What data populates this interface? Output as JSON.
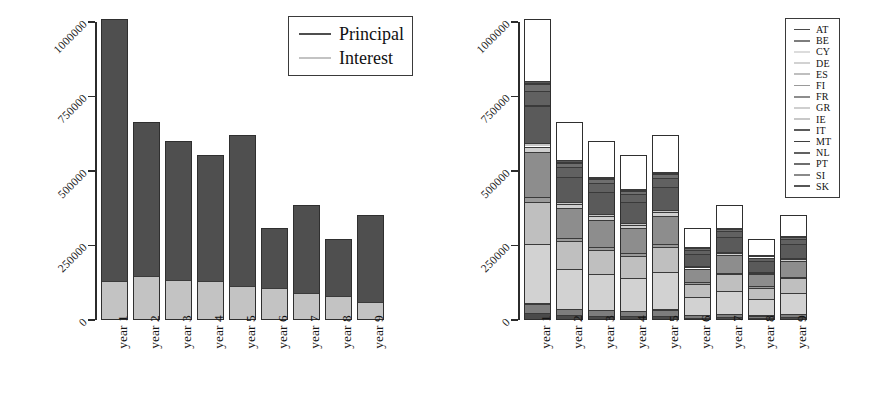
{
  "figure": {
    "background": "#ffffff",
    "ink_color": "#1a1a1a"
  },
  "axis": {
    "y_ticks": [
      "0",
      "250000",
      "500000",
      "750000",
      "1000000"
    ],
    "y_tick_values": [
      0,
      250000,
      500000,
      750000,
      1000000
    ],
    "y_min": 0,
    "y_max": 1050000,
    "x_categories": [
      "year 1",
      "year 2",
      "year 3",
      "year 4",
      "year 5",
      "year 6",
      "year 7",
      "year 8",
      "year 9"
    ]
  },
  "left_panel": {
    "legend": {
      "entries": [
        {
          "label": "Principal",
          "color": "#4f4f4f"
        },
        {
          "label": "Interest",
          "color": "#c3c3c3"
        }
      ]
    }
  },
  "right_panel": {
    "legend": {
      "entries": [
        {
          "label": "AT",
          "color": "#4a4a4a"
        },
        {
          "label": "BE",
          "color": "#7d7d7d"
        },
        {
          "label": "CY",
          "color": "#dcdcdc"
        },
        {
          "label": "DE",
          "color": "#d2d2d2"
        },
        {
          "label": "ES",
          "color": "#bfbfbf"
        },
        {
          "label": "FI",
          "color": "#9a9a9a"
        },
        {
          "label": "FR",
          "color": "#8d8d8d"
        },
        {
          "label": "GR",
          "color": "#cfcfcf"
        },
        {
          "label": "IE",
          "color": "#c8c8c8"
        },
        {
          "label": "IT",
          "color": "#5a5a5a"
        },
        {
          "label": "MT",
          "color": "#3f3f3f"
        },
        {
          "label": "NL",
          "color": "#616161"
        },
        {
          "label": "PT",
          "color": "#6e6e6e"
        },
        {
          "label": "SI",
          "color": "#8a8a8a"
        },
        {
          "label": "SK",
          "color": "#565656"
        }
      ]
    }
  },
  "chart_data": [
    {
      "id": "principal-interest-chart",
      "type": "bar",
      "stacked": true,
      "title": "",
      "xlabel": "",
      "ylabel": "",
      "ylim": [
        0,
        1050000
      ],
      "grid": false,
      "legend_position": "top-right",
      "categories": [
        "year 1",
        "year 2",
        "year 3",
        "year 4",
        "year 5",
        "year 6",
        "year 7",
        "year 8",
        "year 9"
      ],
      "series": [
        {
          "name": "Interest",
          "color": "#c3c3c3",
          "values": [
            130000,
            148000,
            135000,
            132000,
            115000,
            108000,
            90000,
            80000,
            62000
          ]
        },
        {
          "name": "Principal",
          "color": "#4f4f4f",
          "values": [
            880000,
            517000,
            465000,
            423000,
            505000,
            200000,
            295000,
            192000,
            291000
          ]
        }
      ],
      "totals": [
        1010000,
        665000,
        600000,
        555000,
        620000,
        308000,
        385000,
        272000,
        353000
      ]
    },
    {
      "id": "country-breakdown-chart",
      "type": "bar",
      "stacked": true,
      "title": "",
      "xlabel": "",
      "ylabel": "",
      "ylim": [
        0,
        1050000
      ],
      "grid": false,
      "legend_position": "top-right",
      "categories": [
        "year 1",
        "year 2",
        "year 3",
        "year 4",
        "year 5",
        "year 6",
        "year 7",
        "year 8",
        "year 9"
      ],
      "series": [
        {
          "name": "AT",
          "color": "#4a4a4a",
          "values": [
            24000,
            16000,
            14000,
            13000,
            15000,
            7000,
            9000,
            6500,
            8500
          ]
        },
        {
          "name": "BE",
          "color": "#7d7d7d",
          "values": [
            30000,
            20000,
            18000,
            16000,
            19000,
            9000,
            11000,
            8000,
            10500
          ]
        },
        {
          "name": "CY",
          "color": "#dcdcdc",
          "values": [
            2000,
            1500,
            1200,
            1100,
            1300,
            700,
            900,
            600,
            800
          ]
        },
        {
          "name": "DE",
          "color": "#d2d2d2",
          "values": [
            200000,
            135000,
            120000,
            110000,
            125000,
            62000,
            78000,
            55000,
            71000
          ]
        },
        {
          "name": "ES",
          "color": "#bfbfbf",
          "values": [
            140000,
            92000,
            83000,
            76000,
            86000,
            43000,
            54000,
            38000,
            49000
          ]
        },
        {
          "name": "FI",
          "color": "#9a9a9a",
          "values": [
            16000,
            11000,
            9500,
            8800,
            9900,
            5000,
            6200,
            4400,
            5600
          ]
        },
        {
          "name": "FR",
          "color": "#8d8d8d",
          "values": [
            150000,
            100000,
            90000,
            83000,
            93000,
            46000,
            58000,
            41000,
            53000
          ]
        },
        {
          "name": "GR",
          "color": "#cfcfcf",
          "values": [
            20000,
            13000,
            12000,
            11000,
            12500,
            6200,
            7800,
            5500,
            7000
          ]
        },
        {
          "name": "IE",
          "color": "#c8c8c8",
          "values": [
            12000,
            8000,
            7200,
            6600,
            7400,
            3700,
            4700,
            3300,
            4200
          ]
        },
        {
          "name": "IT",
          "color": "#5a5a5a",
          "values": [
            125000,
            83000,
            75000,
            69000,
            77000,
            38000,
            48000,
            34000,
            44000
          ]
        },
        {
          "name": "MT",
          "color": "#3f3f3f",
          "values": [
            1200,
            800,
            700,
            650,
            730,
            360,
            460,
            320,
            410
          ]
        },
        {
          "name": "NL",
          "color": "#616161",
          "values": [
            48000,
            32000,
            29000,
            27000,
            30000,
            15000,
            19000,
            13000,
            17000
          ]
        },
        {
          "name": "PT",
          "color": "#6e6e6e",
          "values": [
            22000,
            15000,
            13000,
            12000,
            13500,
            6700,
            8400,
            6000,
            7600
          ]
        },
        {
          "name": "SI",
          "color": "#8a8a8a",
          "values": [
            4000,
            2700,
            2400,
            2200,
            2500,
            1200,
            1600,
            1100,
            1400
          ]
        },
        {
          "name": "SK",
          "color": "#565656",
          "values": [
            8000,
            5300,
            4800,
            4400,
            5000,
            2500,
            3100,
            2200,
            2800
          ]
        }
      ],
      "totals": [
        1010000,
        665000,
        600000,
        555000,
        620000,
        308000,
        385000,
        272000,
        353000
      ]
    }
  ]
}
